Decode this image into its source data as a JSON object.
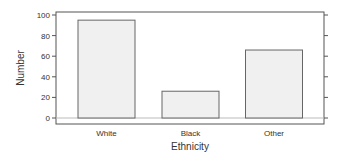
{
  "chart_data": {
    "type": "bar",
    "title": "",
    "xlabel": "Ethnicity",
    "ylabel": "Number",
    "categories": [
      "White",
      "Black",
      "Other"
    ],
    "values": [
      95,
      26,
      66
    ],
    "ylim": [
      -5,
      105
    ],
    "yticks": [
      0,
      20,
      40,
      60,
      80,
      100
    ],
    "ytick_labels": [
      "0",
      "20",
      "40",
      "60",
      "80",
      "100"
    ],
    "grid": false,
    "legend": null,
    "colors": {
      "bar_fill": "#f0f0f0",
      "bar_stroke": "#666666",
      "axis": "#555555",
      "zero_line": "#bbbbbb"
    }
  }
}
